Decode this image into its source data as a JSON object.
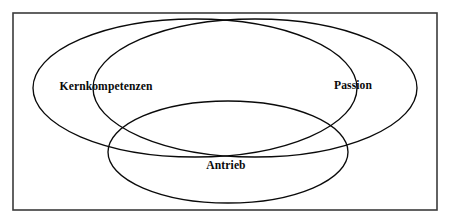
{
  "figure": {
    "type": "venn-diagram",
    "set_count": 3,
    "background_color": "#ffffff",
    "frame": {
      "name": "diagram-border",
      "color": "#3b3b3b",
      "x": 13,
      "y": 13,
      "width": 424,
      "height": 197
    },
    "stroke_color": "#0a0a0a",
    "text_color": "#0a0a0a"
  },
  "sets": [
    {
      "id": "kernkompetenzen",
      "label": "Kernkompetenzen",
      "ellipse": {
        "cx": 195,
        "cy": 88,
        "rx": 162,
        "ry": 69
      },
      "label_pos": {
        "x": 106,
        "y": 87
      }
    },
    {
      "id": "passion",
      "label": "Passion",
      "ellipse": {
        "cx": 255,
        "cy": 88,
        "rx": 162,
        "ry": 69
      },
      "label_pos": {
        "x": 353,
        "y": 86
      }
    },
    {
      "id": "antrieb",
      "label": "Antrieb",
      "ellipse": {
        "cx": 228,
        "cy": 152,
        "rx": 120,
        "ry": 51
      },
      "label_pos": {
        "x": 226,
        "y": 166
      }
    }
  ]
}
